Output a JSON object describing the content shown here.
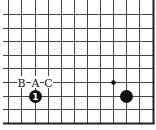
{
  "diagram": {
    "type": "go-board-fragment",
    "corner": "bottom-right",
    "colors": {
      "background": "#ffffff",
      "grid_line": "#444444",
      "edge_line": "#222222",
      "stone_black": "#111111",
      "stone_number": "#ffffff"
    },
    "grid": {
      "vertical_x": [
        8,
        21,
        35,
        48,
        61,
        74,
        87,
        100,
        113,
        126,
        139
      ],
      "right_edge_x": 153,
      "horizontal_y": [
        14,
        28,
        41,
        55,
        68,
        82,
        96,
        109
      ],
      "bottom_edge_y": 123,
      "left_extent_x": 3,
      "top_extent_y": 0
    },
    "star_points": [
      {
        "x": 113,
        "y": 82
      }
    ],
    "stones": [
      {
        "color": "black",
        "x": 35,
        "y": 96,
        "number": "1"
      },
      {
        "color": "black",
        "x": 126,
        "y": 96,
        "number": ""
      }
    ],
    "labels": [
      {
        "text": "B",
        "x": 21,
        "y": 82
      },
      {
        "text": "A",
        "x": 35,
        "y": 82
      },
      {
        "text": "C",
        "x": 48,
        "y": 82
      }
    ]
  }
}
